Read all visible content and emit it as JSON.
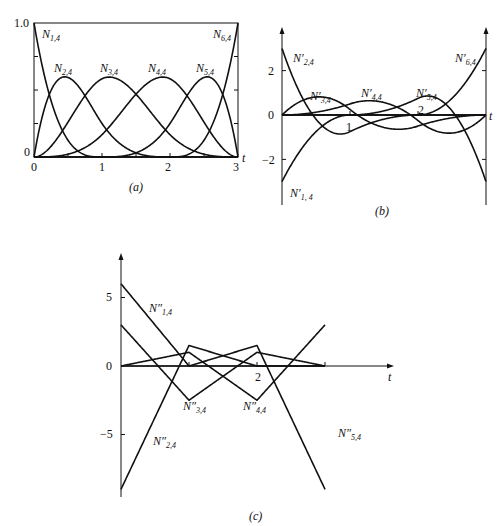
{
  "chart_data": [
    {
      "id": "a",
      "type": "line",
      "caption": "(a)",
      "title": "",
      "xlabel": "t",
      "ylabel": "",
      "xlim": [
        0,
        3
      ],
      "ylim": [
        0,
        1.0
      ],
      "x_ticks": [
        "0",
        "1",
        "2",
        "3"
      ],
      "y_ticks": [
        "0",
        "1.0"
      ],
      "knot_vector": [
        0,
        0,
        0,
        0,
        1,
        2,
        3,
        3,
        3,
        3
      ],
      "order": 4,
      "derivative": 0,
      "series": [
        {
          "name": "N1,4",
          "label_base": "N",
          "label_sub": "1,4",
          "prime": "",
          "values_at": {
            "t": [
              0,
              0.5,
              1,
              1.5,
              2,
              2.5,
              3
            ],
            "y": [
              1,
              0.125,
              0,
              0,
              0,
              0,
              0
            ]
          }
        },
        {
          "name": "N2,4",
          "label_base": "N",
          "label_sub": "2,4",
          "prime": "",
          "values_at": {
            "t": [
              0,
              0.5,
              1,
              1.5,
              2,
              2.5,
              3
            ],
            "y": [
              0,
              0.594,
              0.25,
              0.031,
              0,
              0,
              0
            ]
          }
        },
        {
          "name": "N3,4",
          "label_base": "N",
          "label_sub": "3,4",
          "prime": "",
          "values_at": {
            "t": [
              0,
              0.5,
              1,
              1.5,
              2,
              2.5,
              3
            ],
            "y": [
              0,
              0.26,
              0.583,
              0.448,
              0.167,
              0.021,
              0
            ]
          }
        },
        {
          "name": "N4,4",
          "label_base": "N",
          "label_sub": "4,4",
          "prime": "",
          "values_at": {
            "t": [
              0,
              0.5,
              1,
              1.5,
              2,
              2.5,
              3
            ],
            "y": [
              0,
              0.021,
              0.167,
              0.448,
              0.583,
              0.26,
              0
            ]
          }
        },
        {
          "name": "N5,4",
          "label_base": "N",
          "label_sub": "5,4",
          "prime": "",
          "values_at": {
            "t": [
              0,
              0.5,
              1,
              1.5,
              2,
              2.5,
              3
            ],
            "y": [
              0,
              0,
              0,
              0.031,
              0.25,
              0.594,
              0
            ]
          }
        },
        {
          "name": "N6,4",
          "label_base": "N",
          "label_sub": "6,4",
          "prime": "",
          "values_at": {
            "t": [
              0,
              0.5,
              1,
              1.5,
              2,
              2.5,
              3
            ],
            "y": [
              0,
              0,
              0,
              0,
              0,
              0.125,
              1
            ]
          }
        }
      ]
    },
    {
      "id": "b",
      "type": "line",
      "caption": "(b)",
      "title": "",
      "xlabel": "t",
      "ylabel": "",
      "xlim": [
        0,
        3
      ],
      "ylim": [
        -3,
        3
      ],
      "x_ticks": [
        "1",
        "2"
      ],
      "y_ticks": [
        "2",
        "0",
        "−2"
      ],
      "knot_vector": [
        0,
        0,
        0,
        0,
        1,
        2,
        3,
        3,
        3,
        3
      ],
      "order": 4,
      "derivative": 1,
      "series": [
        {
          "name": "N'1,4",
          "label_base": "N",
          "label_sub": "1, 4",
          "prime": "′"
        },
        {
          "name": "N'2,4",
          "label_base": "N",
          "label_sub": "2,4",
          "prime": "′"
        },
        {
          "name": "N'3,4",
          "label_base": "N",
          "label_sub": "3,4",
          "prime": "′"
        },
        {
          "name": "N'4,4",
          "label_base": "N",
          "label_sub": "4,4",
          "prime": "′"
        },
        {
          "name": "N'5,4",
          "label_base": "N",
          "label_sub": "5,4",
          "prime": "′"
        },
        {
          "name": "N'6,4",
          "label_base": "N",
          "label_sub": "6,4",
          "prime": "′"
        }
      ]
    },
    {
      "id": "c",
      "type": "line",
      "caption": "(c)",
      "title": "",
      "xlabel": "t",
      "ylabel": "",
      "xlim": [
        0,
        3
      ],
      "ylim": [
        -9,
        6
      ],
      "x_ticks": [
        "2"
      ],
      "y_ticks": [
        "5",
        "0",
        "−5"
      ],
      "knot_vector": [
        0,
        0,
        0,
        0,
        1,
        2,
        3,
        3,
        3,
        3
      ],
      "order": 4,
      "derivative": 2,
      "series": [
        {
          "name": "N''1,4",
          "label_base": "N",
          "label_sub": "1,4",
          "prime": "″"
        },
        {
          "name": "N''2,4",
          "label_base": "N",
          "label_sub": "2,4",
          "prime": "″"
        },
        {
          "name": "N''3,4",
          "label_base": "N",
          "label_sub": "3,4",
          "prime": "″"
        },
        {
          "name": "N''4,4",
          "label_base": "N",
          "label_sub": "4,4",
          "prime": "″"
        },
        {
          "name": "N''5,4",
          "label_base": "N",
          "label_sub": "5,4",
          "prime": "″"
        }
      ]
    }
  ]
}
